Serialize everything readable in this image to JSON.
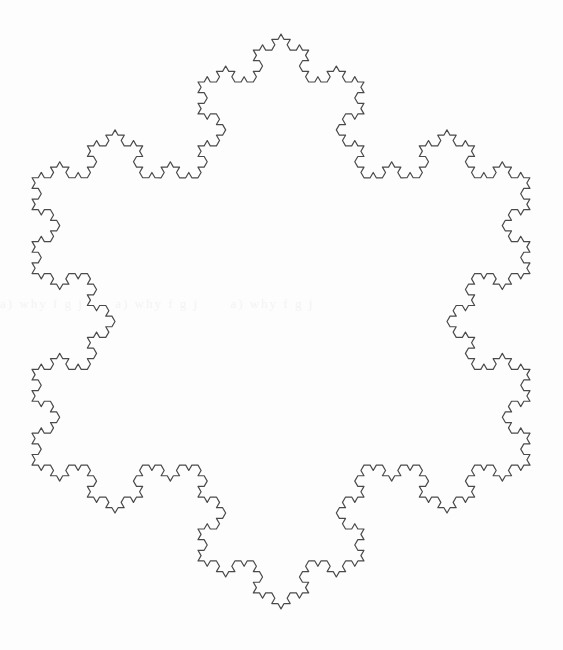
{
  "figure": {
    "name": "koch-snowflake",
    "background_color": "#fdfdfd",
    "stroke_color": "#4a4a4a",
    "stroke_width": 1.2,
    "fill": "none",
    "canvas": {
      "width": 563,
      "height": 650
    }
  },
  "artifacts": {
    "bleed_through_text": "a) why f g j"
  },
  "chart_data": {
    "type": "line",
    "subtitle": "",
    "xlabel": "",
    "ylabel": "",
    "grid": false,
    "legend": null,
    "axes_visible": false,
    "fractal": {
      "name": "Koch snowflake",
      "iterations": 4,
      "base_polygon": "equilateral-triangle",
      "sides": 3,
      "segments_total": 768,
      "rotation_deg": 0,
      "orientation": "point-up",
      "center": {
        "x": 282,
        "y": 322
      },
      "circumradius": 288,
      "bounds": {
        "x_min": 32,
        "x_max": 530,
        "y_min": 26,
        "y_max": 617
      },
      "base_vertices": [
        {
          "x": 282,
          "y": 26
        },
        {
          "x": 531,
          "y": 457
        },
        {
          "x": 33,
          "y": 457
        }
      ],
      "extrema_points": [
        {
          "label": "top-peak",
          "x": 282,
          "y": 26
        },
        {
          "label": "bottom-peak",
          "x": 288,
          "y": 617
        },
        {
          "label": "left-extent",
          "x": 32,
          "y": 322
        },
        {
          "label": "right-extent",
          "x": 530,
          "y": 322
        }
      ]
    }
  }
}
